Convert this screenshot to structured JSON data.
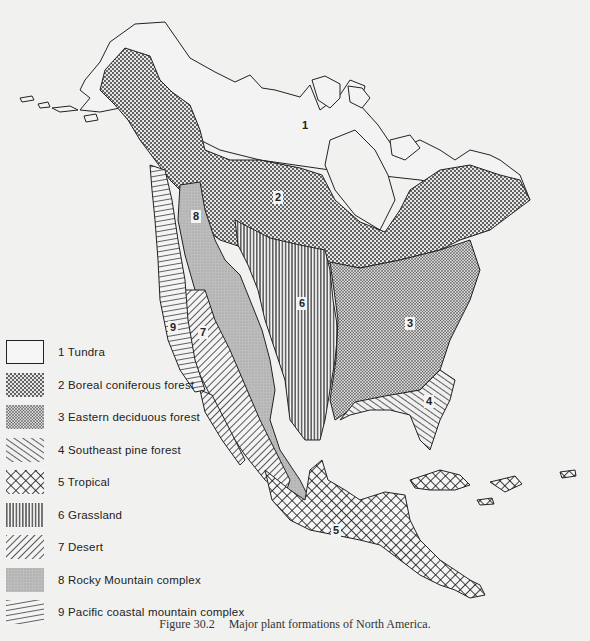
{
  "map": {
    "title": "Major plant formations of North America",
    "region_labels": [
      {
        "id": "1",
        "x": 300,
        "y": 125
      },
      {
        "id": "2",
        "x": 273,
        "y": 197
      },
      {
        "id": "8",
        "x": 191,
        "y": 216
      },
      {
        "id": "6",
        "x": 297,
        "y": 303
      },
      {
        "id": "9",
        "x": 168,
        "y": 327
      },
      {
        "id": "7",
        "x": 198,
        "y": 332
      },
      {
        "id": "3",
        "x": 405,
        "y": 323
      },
      {
        "id": "4",
        "x": 424,
        "y": 401
      },
      {
        "id": "5",
        "x": 331,
        "y": 530
      }
    ]
  },
  "legend": {
    "items": [
      {
        "number": "1",
        "label": "1  Tundra",
        "pattern": "none"
      },
      {
        "number": "2",
        "label": "2  Boreal coniferous forest",
        "pattern": "coarse-dots"
      },
      {
        "number": "3",
        "label": "3  Eastern deciduous forest",
        "pattern": "fine-dots"
      },
      {
        "number": "4",
        "label": "4  Southeast pine forest",
        "pattern": "diagonal-down-lines"
      },
      {
        "number": "5",
        "label": "5  Tropical",
        "pattern": "crosshatch"
      },
      {
        "number": "6",
        "label": "6  Grassland",
        "pattern": "vertical-lines"
      },
      {
        "number": "7",
        "label": "7  Desert",
        "pattern": "diagonal-up-lines"
      },
      {
        "number": "8",
        "label": "8  Rocky Mountain complex",
        "pattern": "gray-stipple"
      },
      {
        "number": "9",
        "label": "9  Pacific coastal mountain complex",
        "pattern": "shallow-diagonal-lines"
      }
    ]
  },
  "caption": {
    "figure": "Figure 30.2",
    "text": "Major plant formations of North America."
  }
}
